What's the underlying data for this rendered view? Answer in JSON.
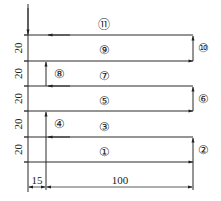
{
  "diagram": {
    "type": "toolpath",
    "step_labels": [
      "①",
      "②",
      "③",
      "④",
      "⑤",
      "⑥",
      "⑦",
      "⑧",
      "⑨",
      "⑩",
      "⑪"
    ],
    "row_spacing_label": "20",
    "row_spacing_count": 5,
    "offset_label": "15",
    "length_label": "100",
    "colors": {
      "line": "#2a2a2a",
      "background": "#ffffff"
    }
  }
}
